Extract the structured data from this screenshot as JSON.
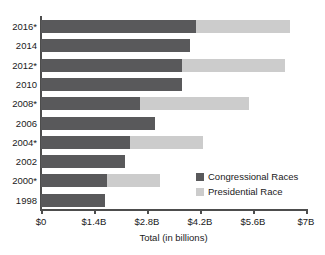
{
  "chart_data": {
    "type": "bar",
    "orientation": "horizontal",
    "stacked": true,
    "title": "",
    "xlabel": "Total (in billions)",
    "ylabel": "",
    "xlim": [
      0,
      7
    ],
    "xticks": [
      0,
      1.4,
      2.8,
      4.2,
      5.6,
      7
    ],
    "xticklabels": [
      "$0",
      "$1.4B",
      "$2.8B",
      "$4.2B",
      "$5.6B",
      "$7B"
    ],
    "categories": [
      "2016*",
      "2014",
      "2012*",
      "2010",
      "2008*",
      "2006",
      "2004*",
      "2002",
      "2000*",
      "1998"
    ],
    "grid": false,
    "legend_position": "inside-lower-right",
    "series": [
      {
        "name": "Congressional Races",
        "color": "#59595b",
        "values": [
          4.09,
          3.93,
          3.72,
          3.72,
          2.61,
          3.01,
          2.35,
          2.22,
          1.74,
          1.69
        ]
      },
      {
        "name": "Presidential Race",
        "color": "#cccccc",
        "values": [
          2.48,
          0,
          2.72,
          0,
          2.88,
          0,
          1.92,
          0,
          1.4,
          0
        ]
      }
    ],
    "totals": [
      6.57,
      3.93,
      6.44,
      3.72,
      5.49,
      3.01,
      4.27,
      2.22,
      3.14,
      1.69
    ]
  },
  "legend": {
    "items": [
      {
        "label": "Congressional Races",
        "color": "#59595b"
      },
      {
        "label": "Presidential Race",
        "color": "#cccccc"
      }
    ]
  }
}
